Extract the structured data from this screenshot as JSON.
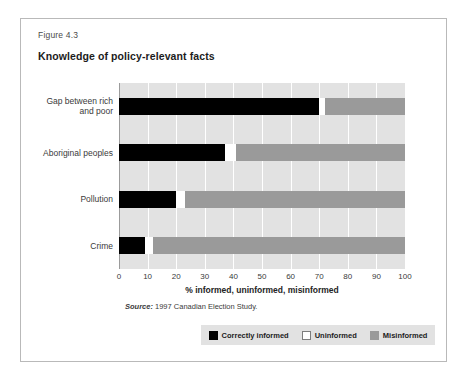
{
  "figure": {
    "number": "Figure 4.3",
    "title": "Knowledge of policy-relevant facts",
    "source_word": "Source:",
    "source_text": " 1997 Canadian Election Study."
  },
  "colors": {
    "correctly_informed": "#000000",
    "uninformed": "#ffffff",
    "misinformed": "#9a9a9a",
    "plot_background": "#e2e2e2",
    "gridline": "#ffffff",
    "frame_border": "#b9b9b9"
  },
  "legend": {
    "position": "bottom",
    "items": [
      {
        "label": "Correctly informed",
        "color": "#000000"
      },
      {
        "label": "Uninformed",
        "color": "#ffffff"
      },
      {
        "label": "Misinformed",
        "color": "#9a9a9a"
      }
    ]
  },
  "chart_data": {
    "type": "bar",
    "orientation": "horizontal",
    "stacked": true,
    "title": "Knowledge of policy-relevant facts",
    "subtitle": "",
    "xlabel": "% informed, uninformed, misinformed",
    "ylabel": "",
    "xlim": [
      0,
      100
    ],
    "xticks": [
      0,
      10,
      20,
      30,
      40,
      50,
      60,
      70,
      80,
      90,
      100
    ],
    "xticklabels": [
      "0",
      "10",
      "20",
      "30",
      "40",
      "50",
      "60",
      "70",
      "80",
      "90",
      "100"
    ],
    "grid": true,
    "grid_axis": "x",
    "legend_position": "bottom",
    "categories": [
      "Gap between rich and poor",
      "Aboriginal peoples",
      "Pollution",
      "Crime"
    ],
    "series": [
      {
        "name": "Correctly informed",
        "color": "#000000",
        "values": [
          70,
          37,
          20,
          9
        ]
      },
      {
        "name": "Uninformed",
        "color": "#ffffff",
        "values": [
          2,
          4,
          3,
          3
        ]
      },
      {
        "name": "Misinformed",
        "color": "#9a9a9a",
        "values": [
          28,
          59,
          77,
          88
        ]
      }
    ],
    "annotations": [
      "Source: 1997 Canadian Election Study."
    ]
  },
  "category_label_lines": [
    [
      "Gap between rich",
      "and poor"
    ],
    [
      "Aboriginal peoples"
    ],
    [
      "Pollution"
    ],
    [
      "Crime"
    ]
  ]
}
